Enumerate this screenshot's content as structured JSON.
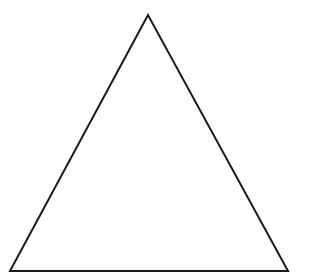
{
  "diagram": {
    "shape": "triangle",
    "type": "equilateral-like",
    "stroke_color": "#1a1a1a",
    "fill_color": "#ffffff",
    "stroke_width": 2,
    "vertices": {
      "apex": [
        148,
        15
      ],
      "bottom_left": [
        10,
        271
      ],
      "bottom_right": [
        288,
        271
      ]
    }
  }
}
